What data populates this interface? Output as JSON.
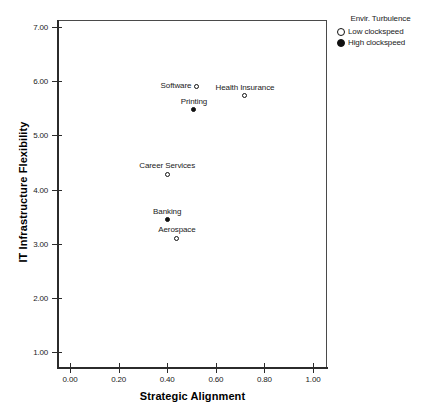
{
  "chart_data": {
    "type": "scatter",
    "title": "",
    "xlabel": "Strategic Alignment",
    "ylabel": "IT Infrastructure Flexibility",
    "xlim": [
      0.0,
      1.0
    ],
    "ylim": [
      1.0,
      7.0
    ],
    "grid": false,
    "x_ticks": [
      "0.00",
      "0.20",
      "0.40",
      "0.60",
      "0.80",
      "1.00"
    ],
    "x_tick_values": [
      0.0,
      0.2,
      0.4,
      0.6,
      0.8,
      1.0
    ],
    "y_ticks": [
      "1.00",
      "2.00",
      "3.00",
      "4.00",
      "5.00",
      "6.00",
      "7.00"
    ],
    "y_tick_values": [
      1,
      2,
      3,
      4,
      5,
      6,
      7
    ],
    "legend": {
      "title": "Envir. Turbulence",
      "position": "top-right",
      "entries": [
        {
          "label": "Low clockspeed",
          "marker": "open-circle",
          "group": "low"
        },
        {
          "label": "High clockspeed",
          "marker": "filled-circle",
          "group": "high"
        }
      ]
    },
    "points": [
      {
        "label": "Software",
        "x": 0.52,
        "y": 5.91,
        "group": "low",
        "label_pos": "left"
      },
      {
        "label": "Health Insurance",
        "x": 0.72,
        "y": 5.73,
        "group": "low",
        "label_pos": "above"
      },
      {
        "label": "Printing",
        "x": 0.51,
        "y": 5.47,
        "group": "high",
        "label_pos": "above"
      },
      {
        "label": "Career Services",
        "x": 0.4,
        "y": 4.28,
        "group": "low",
        "label_pos": "above"
      },
      {
        "label": "Banking",
        "x": 0.4,
        "y": 3.44,
        "group": "high",
        "label_pos": "above"
      },
      {
        "label": "Aerospace",
        "x": 0.44,
        "y": 3.1,
        "group": "low",
        "label_pos": "above"
      }
    ]
  }
}
